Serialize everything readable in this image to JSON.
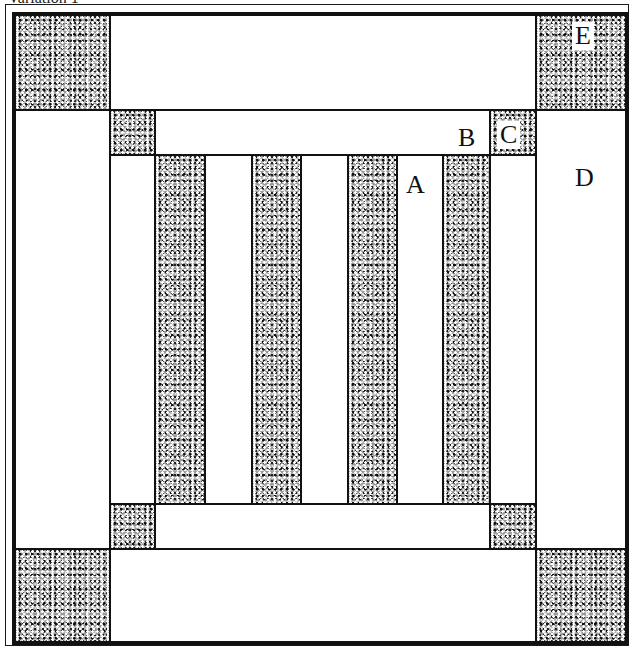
{
  "caption": "Variation 1",
  "diagram": {
    "labels": {
      "A": "A",
      "B": "B",
      "C": "C",
      "D": "D",
      "E": "E"
    },
    "colors": {
      "line": "#111111",
      "shaded": "#9a9a9a",
      "plain": "#ffffff"
    },
    "stripes": {
      "shaded_count": 4,
      "plain_count": 3
    }
  }
}
